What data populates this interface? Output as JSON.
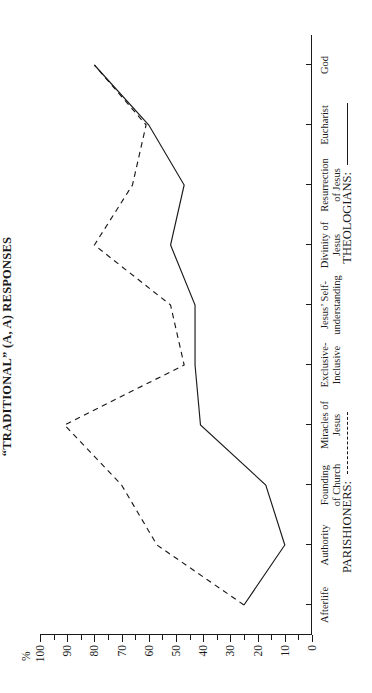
{
  "chart_data": {
    "type": "line",
    "title": "“TRADITIONAL” (A, A) RESPONSES",
    "xlabel": "",
    "ylabel": "%",
    "ylim": [
      0,
      100
    ],
    "ytick_step_minor": 5,
    "ytick_step_major": 10,
    "ytick_labels": [
      "0",
      "10",
      "20",
      "30",
      "40",
      "50",
      "60",
      "70",
      "80",
      "90",
      "100"
    ],
    "grid": false,
    "orientation": "rotated-90-categories-on-vertical-axis",
    "legend_position": "below-axis",
    "categories": [
      "Afterlife",
      "Authority",
      "Founding\nof Church",
      "Miracles of\nJesus",
      "Exclusive-\nInclusive",
      "Jesus’ Self-\nunderstanding",
      "Divinity of\nJesus",
      "Resurrection\nof Jesus",
      "Eucharist",
      "God"
    ],
    "series": [
      {
        "name": "PARISHIONERS:",
        "style": "dashed",
        "values": [
          25,
          57,
          70,
          91,
          47,
          52,
          80,
          66,
          61,
          80
        ]
      },
      {
        "name": "THEOLOGIANS:",
        "style": "solid",
        "values": [
          25,
          10,
          17,
          41,
          43,
          43,
          52,
          47,
          60,
          80
        ]
      }
    ]
  },
  "legend": {
    "parishioners_label": "PARISHIONERS:",
    "theologians_label": "THEOLOGIANS:"
  }
}
